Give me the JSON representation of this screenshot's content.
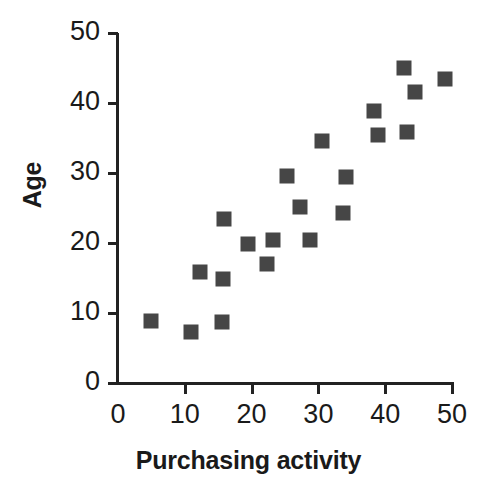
{
  "chart_data": {
    "type": "scatter",
    "title": "",
    "xlabel": "Purchasing activity",
    "ylabel": "Age",
    "xlim": [
      0,
      50
    ],
    "ylim": [
      0,
      50
    ],
    "xticks": [
      0,
      10,
      20,
      30,
      40,
      50
    ],
    "yticks": [
      0,
      10,
      20,
      30,
      40,
      50
    ],
    "xticklabels": [
      "0",
      "10",
      "20",
      "30",
      "40",
      "50"
    ],
    "yticklabels": [
      "0",
      "10",
      "20",
      "30",
      "40",
      "50"
    ],
    "grid": false,
    "legend": null,
    "marker_shape": "square",
    "marker_color": "#464646",
    "series": [
      {
        "name": "observations",
        "points": [
          {
            "x": 5.0,
            "y": 8.8
          },
          {
            "x": 11.0,
            "y": 7.3
          },
          {
            "x": 12.3,
            "y": 15.9
          },
          {
            "x": 15.6,
            "y": 8.7
          },
          {
            "x": 15.7,
            "y": 14.9
          },
          {
            "x": 15.8,
            "y": 23.4
          },
          {
            "x": 19.5,
            "y": 19.8
          },
          {
            "x": 22.3,
            "y": 17.0
          },
          {
            "x": 23.2,
            "y": 20.4
          },
          {
            "x": 25.3,
            "y": 29.6
          },
          {
            "x": 27.3,
            "y": 25.1
          },
          {
            "x": 28.8,
            "y": 20.4
          },
          {
            "x": 30.5,
            "y": 34.6
          },
          {
            "x": 33.7,
            "y": 24.3
          },
          {
            "x": 34.2,
            "y": 29.4
          },
          {
            "x": 38.3,
            "y": 38.8
          },
          {
            "x": 38.9,
            "y": 35.4
          },
          {
            "x": 42.8,
            "y": 45.0
          },
          {
            "x": 43.2,
            "y": 35.9
          },
          {
            "x": 44.5,
            "y": 41.6
          },
          {
            "x": 48.9,
            "y": 43.4
          }
        ]
      }
    ]
  },
  "axis": {
    "y_label": "Age",
    "x_label": "Purchasing activity"
  },
  "colors": {
    "marker": "#464646",
    "axis": "#222222",
    "text": "#1a1a1a",
    "background": "#ffffff"
  }
}
